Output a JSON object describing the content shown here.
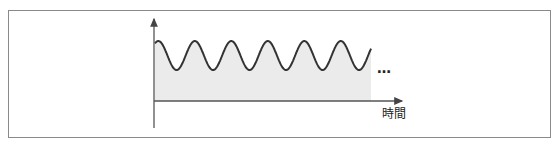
{
  "diagram": {
    "type": "periodic-wave",
    "x_axis_label": "時間",
    "continuation": "…",
    "cycles_shown": 5.5,
    "colors": {
      "frame": "#8a8a8a",
      "axis": "#555555",
      "wave": "#333333",
      "fill": "#ebebeb"
    }
  }
}
